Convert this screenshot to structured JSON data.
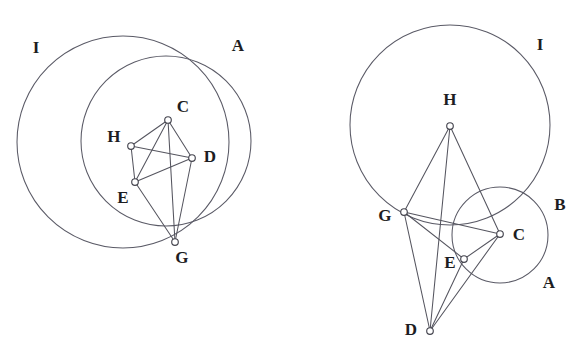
{
  "document": {
    "title": "Two circle-and-polygon geometric constructions",
    "width": 588,
    "height": 360,
    "background_color": "#ffffff",
    "stroke_color": "#55555f",
    "label_color": "#1d1d22",
    "vertex_fill_color": "#ffffff"
  },
  "figures": [
    {
      "id": "left-figure",
      "name": "left-construction",
      "circles": [
        {
          "id": "left-circle-I",
          "label": "I",
          "cx": 123,
          "cy": 142,
          "r": 106,
          "label_x": 36,
          "label_y": 49
        },
        {
          "id": "left-circle-A",
          "label": "A",
          "cx": 166,
          "cy": 141,
          "r": 85,
          "label_x": 238,
          "label_y": 47
        }
      ],
      "points": [
        {
          "id": "left-C",
          "label": "C",
          "x": 168,
          "y": 120,
          "label_x": 183,
          "label_y": 108
        },
        {
          "id": "left-H",
          "label": "H",
          "x": 131,
          "y": 146,
          "label_x": 114,
          "label_y": 138
        },
        {
          "id": "left-D",
          "label": "D",
          "x": 192,
          "y": 158,
          "label_x": 210,
          "label_y": 158
        },
        {
          "id": "left-E",
          "label": "E",
          "x": 135,
          "y": 182,
          "label_x": 123,
          "label_y": 199
        },
        {
          "id": "left-G",
          "label": "G",
          "x": 175,
          "y": 242,
          "label_x": 182,
          "label_y": 259
        }
      ],
      "edges": [
        {
          "from": "left-H",
          "to": "left-C"
        },
        {
          "from": "left-C",
          "to": "left-D"
        },
        {
          "from": "left-H",
          "to": "left-D"
        },
        {
          "from": "left-H",
          "to": "left-E"
        },
        {
          "from": "left-E",
          "to": "left-D"
        },
        {
          "from": "left-C",
          "to": "left-E"
        },
        {
          "from": "left-E",
          "to": "left-G"
        },
        {
          "from": "left-C",
          "to": "left-G"
        },
        {
          "from": "left-D",
          "to": "left-G"
        }
      ]
    },
    {
      "id": "right-figure",
      "name": "right-construction",
      "circles": [
        {
          "id": "right-circle-I",
          "label": "I",
          "cx": 450,
          "cy": 125,
          "r": 100,
          "label_x": 540,
          "label_y": 46
        },
        {
          "id": "right-circle-B",
          "label": "B",
          "cx": 500,
          "cy": 235,
          "r": 48,
          "label_x": 560,
          "label_y": 206
        },
        {
          "id": "right-circle-A-label",
          "label": "A",
          "label_x": 549,
          "label_y": 284
        }
      ],
      "points": [
        {
          "id": "right-H",
          "label": "H",
          "x": 450,
          "y": 126,
          "label_x": 450,
          "label_y": 101
        },
        {
          "id": "right-G",
          "label": "G",
          "x": 404,
          "y": 212,
          "label_x": 385,
          "label_y": 217
        },
        {
          "id": "right-C",
          "label": "C",
          "x": 500,
          "y": 234,
          "label_x": 519,
          "label_y": 236
        },
        {
          "id": "right-E",
          "label": "E",
          "x": 464,
          "y": 259,
          "label_x": 450,
          "label_y": 264
        },
        {
          "id": "right-D",
          "label": "D",
          "x": 430,
          "y": 331,
          "label_x": 411,
          "label_y": 331
        }
      ],
      "edges": [
        {
          "from": "right-H",
          "to": "right-G"
        },
        {
          "from": "right-H",
          "to": "right-D"
        },
        {
          "from": "right-H",
          "to": "right-C"
        },
        {
          "from": "right-G",
          "to": "right-E"
        },
        {
          "from": "right-G",
          "to": "right-C"
        },
        {
          "from": "right-G",
          "to": "right-D"
        },
        {
          "from": "right-E",
          "to": "right-C"
        },
        {
          "from": "right-E",
          "to": "right-D"
        },
        {
          "from": "right-C",
          "to": "right-D"
        }
      ]
    }
  ]
}
